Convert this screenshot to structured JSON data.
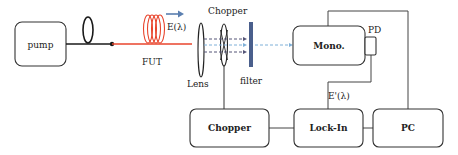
{
  "diagram": {
    "title": "",
    "colors": {
      "fiber": "#1a1a1a",
      "fut_fiber": "#e8442c",
      "arrow": "#5b7fb0",
      "filter": "#4a5f8c",
      "beam_dark": "#555577",
      "beam_light": "#7fb0d8",
      "wire": "#444444"
    },
    "nodes": {
      "pump": {
        "label": "pump"
      },
      "fut": {
        "label": "FUT",
        "field_label": "E(λ)"
      },
      "lens": {
        "label": "Lens"
      },
      "chopper_wheel": {
        "label": "Chopper"
      },
      "filter": {
        "label": "filter"
      },
      "mono": {
        "label": "Mono."
      },
      "pd": {
        "label": "PD"
      },
      "chopper_box": {
        "label": "Chopper"
      },
      "lockin": {
        "label": "Lock-In"
      },
      "pc": {
        "label": "PC"
      }
    },
    "signal_label": "E'(λ)",
    "edges": [
      {
        "from": "pump",
        "to": "fut",
        "type": "fiber"
      },
      {
        "from": "fut",
        "to": "lens",
        "type": "optical"
      },
      {
        "from": "lens",
        "to": "chopper_wheel",
        "type": "optical"
      },
      {
        "from": "chopper_wheel",
        "to": "filter",
        "type": "optical"
      },
      {
        "from": "filter",
        "to": "mono",
        "type": "optical"
      },
      {
        "from": "pd",
        "to": "lockin",
        "type": "electrical",
        "label": "E'(λ)"
      },
      {
        "from": "chopper_wheel",
        "to": "chopper_box",
        "type": "mechanical"
      },
      {
        "from": "chopper_box",
        "to": "lockin",
        "type": "electrical"
      },
      {
        "from": "lockin",
        "to": "pc",
        "type": "electrical"
      },
      {
        "from": "mono",
        "to": "pc",
        "type": "electrical"
      }
    ]
  }
}
